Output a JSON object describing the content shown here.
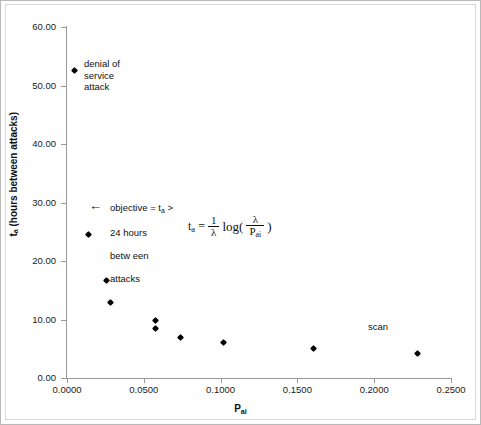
{
  "chart_data": {
    "type": "scatter",
    "title": "",
    "xlabel": "P_ai",
    "ylabel": "t_a (hours between attacks)",
    "xlim": [
      0.0,
      0.25
    ],
    "ylim": [
      0.0,
      60.0
    ],
    "grid": false,
    "legend": "none",
    "x_ticks": [
      "0.0000",
      "0.0500",
      "0.1000",
      "0.1500",
      "0.2000",
      "0.2500"
    ],
    "x_tick_values": [
      0.0,
      0.05,
      0.1,
      0.15,
      0.2,
      0.25
    ],
    "y_ticks": [
      "0.00",
      "10.00",
      "20.00",
      "30.00",
      "40.00",
      "50.00",
      "60.00"
    ],
    "y_tick_values": [
      0,
      10,
      20,
      30,
      40,
      50,
      60
    ],
    "points": [
      {
        "x": 0.0052,
        "y": 52.5,
        "label": "denial of service attack"
      },
      {
        "x": 0.0143,
        "y": 24.6,
        "label": ""
      },
      {
        "x": 0.0254,
        "y": 16.7,
        "label": ""
      },
      {
        "x": 0.028,
        "y": 12.9,
        "label": ""
      },
      {
        "x": 0.0579,
        "y": 9.9,
        "label": ""
      },
      {
        "x": 0.0579,
        "y": 8.5,
        "label": ""
      },
      {
        "x": 0.0742,
        "y": 7.0,
        "label": ""
      },
      {
        "x": 0.1016,
        "y": 6.0,
        "label": ""
      },
      {
        "x": 0.1608,
        "y": 5.0,
        "label": ""
      },
      {
        "x": 0.2285,
        "y": 4.2,
        "label": "scan"
      }
    ],
    "annotations": [
      {
        "name": "denial-of-service",
        "text": "denial of\nservice\nattack",
        "x": 0.0052,
        "y": 52.5
      },
      {
        "name": "objective",
        "text": "objective = tₐ >\n24 hours\nbetween\nattacks",
        "x": 0.014,
        "y": 30.5
      },
      {
        "name": "scan",
        "text": "scan",
        "x": 0.197,
        "y": 8.9
      },
      {
        "name": "formula",
        "text": "tₐ = (1/λ) log( λ / Pₐᵢ )",
        "x": 0.08,
        "y": 27.0
      }
    ]
  },
  "axes": {
    "x_title_base": "P",
    "x_title_sub": "ai",
    "y_title_base": "t",
    "y_title_sub": "a",
    "y_title_rest": " (hours between attacks)"
  },
  "annotations": {
    "dos": "denial of\nservice\nattack",
    "objective": "objective = tₐ >\n24 hours\nbetween\nattacks",
    "objective_line1_pre": "objective = t",
    "objective_line1_sub": "a",
    "objective_line1_post": " >",
    "objective_line2": "24 hours",
    "objective_line3": "betw een",
    "objective_line4": "attacks",
    "scan": "scan",
    "arrow": "←"
  },
  "formula": {
    "lhs_base": "t",
    "lhs_sub": "a",
    "equals": "=",
    "num": "1",
    "den": "λ",
    "log": "log(",
    "frac_num": "λ",
    "frac_den_base": "P",
    "frac_den_sub": "ai",
    "close": ")"
  }
}
